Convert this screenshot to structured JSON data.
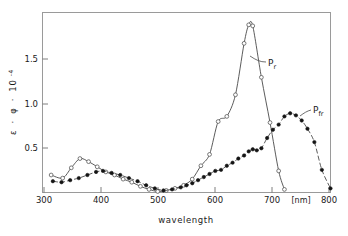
{
  "chart_data": {
    "type": "line",
    "title": "",
    "xlabel": "wavelength",
    "ylabel": "ε · φ · 10⁻⁴",
    "x_unit": "[nm]",
    "xlim": [
      300,
      800
    ],
    "ylim": [
      0,
      1.75
    ],
    "xticks": [
      300,
      400,
      500,
      600,
      700,
      800
    ],
    "xticklabels": [
      "300",
      "400",
      "500",
      "600",
      "700",
      "800"
    ],
    "yticks": [
      0.5,
      1.0,
      1.5
    ],
    "yticklabels": [
      "0.5",
      "1.0",
      "1.5"
    ],
    "grid": false,
    "legend_position": "inline-annotations",
    "series": [
      {
        "name": "Pr",
        "label_main": "P",
        "label_sub": "r",
        "marker": "open-circle",
        "line_style": "solid",
        "x": [
          315,
          335,
          350,
          365,
          380,
          395,
          410,
          425,
          440,
          455,
          470,
          485,
          500,
          515,
          530,
          545,
          560,
          575,
          590,
          605,
          620,
          635,
          650,
          658,
          665,
          680,
          695,
          710,
          720
        ],
        "y": [
          0.17,
          0.14,
          0.24,
          0.33,
          0.3,
          0.25,
          0.2,
          0.17,
          0.13,
          0.1,
          0.06,
          0.03,
          0.01,
          0.02,
          0.04,
          0.07,
          0.13,
          0.26,
          0.37,
          0.69,
          0.74,
          0.95,
          1.45,
          1.63,
          1.62,
          1.12,
          0.68,
          0.21,
          0.03
        ]
      },
      {
        "name": "Pfr",
        "label_main": "P",
        "label_sub": "fr",
        "marker": "filled-circle",
        "line_style": "dash-dot",
        "x": [
          318,
          333,
          348,
          363,
          378,
          393,
          405,
          420,
          435,
          450,
          465,
          480,
          495,
          510,
          525,
          540,
          550,
          560,
          570,
          580,
          590,
          600,
          610,
          620,
          630,
          640,
          650,
          658,
          665,
          672,
          680,
          690,
          700,
          710,
          720,
          730,
          740,
          750,
          760,
          772,
          785,
          800
        ],
        "y": [
          0.11,
          0.1,
          0.12,
          0.14,
          0.17,
          0.2,
          0.21,
          0.19,
          0.17,
          0.14,
          0.11,
          0.07,
          0.04,
          0.02,
          0.03,
          0.05,
          0.07,
          0.09,
          0.12,
          0.15,
          0.18,
          0.21,
          0.22,
          0.26,
          0.29,
          0.33,
          0.36,
          0.4,
          0.42,
          0.41,
          0.43,
          0.53,
          0.61,
          0.66,
          0.74,
          0.77,
          0.75,
          0.7,
          0.62,
          0.49,
          0.22,
          0.04
        ]
      }
    ]
  },
  "axes": {
    "y_label_parts": {
      "epsilon": "ε",
      "dot1": "·",
      "phi": "φ",
      "dot2": "·",
      "base": "10",
      "exponent": "-4"
    },
    "x_axis_title": "wavelength",
    "x_axis_unit": "[nm]"
  }
}
